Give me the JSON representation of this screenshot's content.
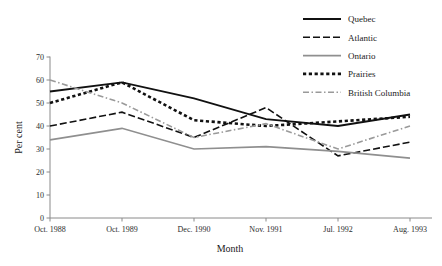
{
  "chart_data": {
    "type": "line",
    "title": "",
    "xlabel": "Month",
    "ylabel": "Per cent",
    "categories": [
      "Oct. 1988",
      "Oct. 1989",
      "Dec. 1990",
      "Nov. 1991",
      "Jul. 1992",
      "Aug. 1993"
    ],
    "ylim": [
      0,
      70
    ],
    "yticks": [
      0,
      10,
      20,
      30,
      40,
      50,
      60,
      70
    ],
    "ytick_labels": [
      "0",
      "10",
      "20",
      "30",
      "40",
      "50",
      "60",
      "70"
    ],
    "grid": false,
    "legend_position": "top-right",
    "series": [
      {
        "name": "Quebec",
        "values": [
          55,
          59,
          52,
          43,
          40,
          45
        ],
        "color": "#111111",
        "style": "solid",
        "width": 1.8,
        "dash": "none"
      },
      {
        "name": "Atlantic",
        "values": [
          40,
          46,
          35,
          48,
          27,
          33
        ],
        "color": "#111111",
        "style": "dashed",
        "width": 1.6,
        "dash": "7,3"
      },
      {
        "name": "Ontario",
        "values": [
          34,
          39,
          30,
          31,
          29,
          26
        ],
        "color": "#8f8f8f",
        "style": "solid",
        "width": 1.7,
        "dash": "none"
      },
      {
        "name": "Prairies",
        "values": [
          50,
          59,
          42.5,
          40,
          42,
          44
        ],
        "color": "#111111",
        "style": "dotted",
        "width": 2.6,
        "dash": "3.2,2.6"
      },
      {
        "name": "British Columbia",
        "values": [
          60,
          50,
          35,
          41,
          30,
          40
        ],
        "color": "#9a9a9a",
        "style": "dash-dot",
        "width": 1.6,
        "dash": "6,2.5,1.5,2.5"
      }
    ]
  },
  "axes": {
    "y_label": "Per cent",
    "x_label": "Month"
  },
  "legend": {
    "entries": [
      {
        "label": "Quebec"
      },
      {
        "label": "Atlantic"
      },
      {
        "label": "Ontario"
      },
      {
        "label": "Prairies"
      },
      {
        "label": "British Columbia"
      }
    ]
  }
}
